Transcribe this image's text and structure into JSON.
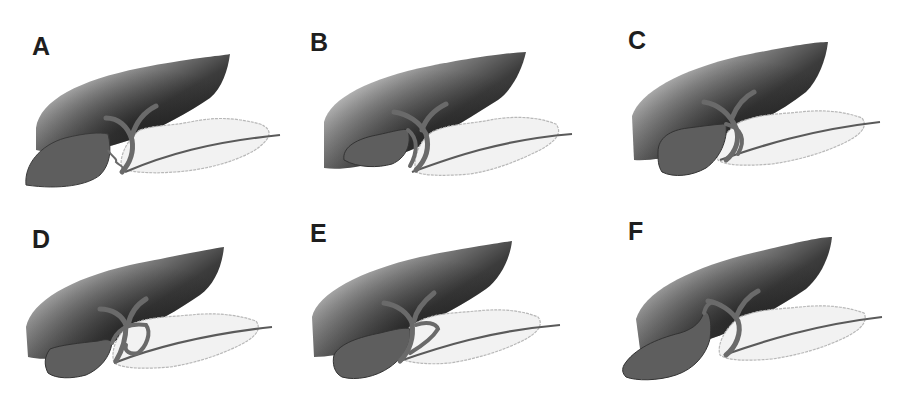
{
  "figure": {
    "type": "anatomical illustration grid",
    "panels": [
      {
        "label": "A",
        "variant": "gallbladder large, cystic duct tortuous joining low",
        "col": 0,
        "row": 0
      },
      {
        "label": "B",
        "variant": "cystic duct running parallel to common duct",
        "col": 1,
        "row": 0
      },
      {
        "label": "C",
        "variant": "cystic duct parallel, close alongside common duct",
        "col": 2,
        "row": 0
      },
      {
        "label": "D",
        "variant": "cystic duct spiralling anterior to common duct",
        "col": 0,
        "row": 1
      },
      {
        "label": "E",
        "variant": "cystic duct joining with angled loop",
        "col": 1,
        "row": 1
      },
      {
        "label": "F",
        "variant": "high insertion of cystic duct",
        "col": 2,
        "row": 1
      }
    ]
  },
  "colors": {
    "background": "#ffffff",
    "liver_dark": "#2a2a2a",
    "liver_light": "#d8d8d8",
    "gallbladder": "#5e5e5e",
    "duct": "#6a6a6a",
    "pancreas_fill": "#f2f2f2",
    "pancreas_outline": "#b4b4b4",
    "label": "#1e1e1e"
  }
}
